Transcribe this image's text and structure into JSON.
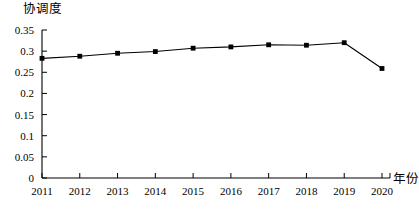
{
  "chart_data": {
    "type": "line",
    "title": "",
    "xlabel": "年份",
    "ylabel": "协调度",
    "categories": [
      "2011",
      "2012",
      "2013",
      "2014",
      "2015",
      "2016",
      "2017",
      "2018",
      "2019",
      "2020"
    ],
    "values": [
      0.283,
      0.288,
      0.295,
      0.299,
      0.307,
      0.31,
      0.315,
      0.314,
      0.32,
      0.259
    ],
    "series": [
      {
        "name": "协调度",
        "values": [
          0.283,
          0.288,
          0.295,
          0.299,
          0.307,
          0.31,
          0.315,
          0.314,
          0.32,
          0.259
        ]
      }
    ],
    "ylim": [
      0,
      0.35
    ],
    "yticks": [
      0,
      0.05,
      0.1,
      0.15,
      0.2,
      0.25,
      0.3,
      0.35
    ],
    "ytick_labels": [
      "0",
      "0.05",
      "0.1",
      "0.15",
      "0.2",
      "0.25",
      "0.3",
      "0.35"
    ],
    "xtick_labels": [
      "2011",
      "2012",
      "2013",
      "2014",
      "2015",
      "2016",
      "2017",
      "2018",
      "2019",
      "2020"
    ],
    "grid": false,
    "legend": "none",
    "line_color": "#000000",
    "marker": "square",
    "marker_color": "#000000"
  }
}
